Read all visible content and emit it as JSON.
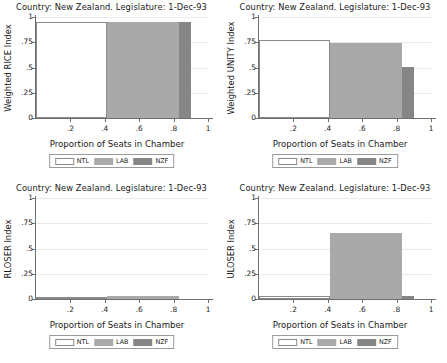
{
  "figure": {
    "panel_title": "Country: New Zealand. Legislature: 1-Dec-93",
    "xlabel": "Proportion of Seats in Chamber",
    "legend": {
      "items": [
        {
          "key": "ntl",
          "label": "NTL",
          "color": "#ffffff"
        },
        {
          "key": "lab",
          "label": "LAB",
          "color": "#a9a9a9"
        },
        {
          "key": "nzf",
          "label": "NZF",
          "color": "#868686"
        }
      ]
    },
    "xticks": [
      "0",
      ".2",
      ".4",
      ".6",
      ".8",
      "1"
    ],
    "yticks": [
      "0",
      ".25",
      ".5",
      ".75",
      "1"
    ]
  },
  "chart_data": [
    {
      "id": "rice",
      "type": "bar",
      "title": "Country: New Zealand. Legislature: 1-Dec-93",
      "xlabel": "Proportion of Seats in Chamber",
      "ylabel": "Weighted RICE Index",
      "xlim": [
        0,
        1
      ],
      "ylim": [
        0,
        1
      ],
      "xticks": [
        0,
        0.2,
        0.4,
        0.6,
        0.8,
        1
      ],
      "xtick_labels": [
        "0",
        ".2",
        ".4",
        ".6",
        ".8",
        "1"
      ],
      "yticks": [
        0,
        0.25,
        0.5,
        0.75,
        1
      ],
      "ytick_labels": [
        "0",
        ".25",
        ".5",
        ".75",
        "1"
      ],
      "grid": true,
      "legend_position": "bottom",
      "bars": [
        {
          "name": "NTL",
          "x_start": 0.0,
          "x_end": 0.41,
          "width": 0.41,
          "value": 0.95
        },
        {
          "name": "LAB",
          "x_start": 0.41,
          "x_end": 0.83,
          "width": 0.42,
          "value": 0.95
        },
        {
          "name": "NZF",
          "x_start": 0.83,
          "x_end": 0.9,
          "width": 0.07,
          "value": 0.95
        }
      ]
    },
    {
      "id": "unity",
      "type": "bar",
      "title": "Country: New Zealand. Legislature: 1-Dec-93",
      "xlabel": "Proportion of Seats in Chamber",
      "ylabel": "Weighted UNITY Index",
      "xlim": [
        0,
        1
      ],
      "ylim": [
        0,
        1
      ],
      "xticks": [
        0,
        0.2,
        0.4,
        0.6,
        0.8,
        1
      ],
      "xtick_labels": [
        "0",
        ".2",
        ".4",
        ".6",
        ".8",
        "1"
      ],
      "yticks": [
        0,
        0.25,
        0.5,
        0.75,
        1
      ],
      "ytick_labels": [
        "0",
        ".25",
        ".5",
        ".75",
        "1"
      ],
      "grid": true,
      "legend_position": "bottom",
      "bars": [
        {
          "name": "NTL",
          "x_start": 0.0,
          "x_end": 0.41,
          "width": 0.41,
          "value": 0.77
        },
        {
          "name": "LAB",
          "x_start": 0.41,
          "x_end": 0.83,
          "width": 0.42,
          "value": 0.745
        },
        {
          "name": "NZF",
          "x_start": 0.83,
          "x_end": 0.9,
          "width": 0.07,
          "value": 0.51
        }
      ]
    },
    {
      "id": "rloser",
      "type": "bar",
      "title": "Country: New Zealand. Legislature: 1-Dec-93",
      "xlabel": "Proportion of Seats in Chamber",
      "ylabel": "RLOSER Index",
      "xlim": [
        0,
        1
      ],
      "ylim": [
        0,
        1
      ],
      "xticks": [
        0,
        0.2,
        0.4,
        0.6,
        0.8,
        1
      ],
      "xtick_labels": [
        "0",
        ".2",
        ".4",
        ".6",
        ".8",
        "1"
      ],
      "yticks": [
        0,
        0.25,
        0.5,
        0.75,
        1
      ],
      "ytick_labels": [
        "0",
        ".25",
        ".5",
        ".75",
        "1"
      ],
      "grid": true,
      "legend_position": "bottom",
      "bars": [
        {
          "name": "NTL",
          "x_start": 0.0,
          "x_end": 0.41,
          "width": 0.41,
          "value": 0.022
        },
        {
          "name": "LAB",
          "x_start": 0.41,
          "x_end": 0.83,
          "width": 0.42,
          "value": 0.025
        },
        {
          "name": "NZF",
          "x_start": 0.83,
          "x_end": 0.9,
          "width": 0.07,
          "value": 0.0
        }
      ]
    },
    {
      "id": "uloser",
      "type": "bar",
      "title": "Country: New Zealand. Legislature: 1-Dec-93",
      "xlabel": "Proportion of Seats in Chamber",
      "ylabel": "ULOSER Index",
      "xlim": [
        0,
        1
      ],
      "ylim": [
        0,
        1
      ],
      "xticks": [
        0,
        0.2,
        0.4,
        0.6,
        0.8,
        1
      ],
      "xtick_labels": [
        "0",
        ".2",
        ".4",
        ".6",
        ".8",
        "1"
      ],
      "yticks": [
        0,
        0.25,
        0.5,
        0.75,
        1
      ],
      "ytick_labels": [
        "0",
        ".25",
        ".5",
        ".75",
        "1"
      ],
      "grid": true,
      "legend_position": "bottom",
      "bars": [
        {
          "name": "NTL",
          "x_start": 0.0,
          "x_end": 0.41,
          "width": 0.41,
          "value": 0.025
        },
        {
          "name": "LAB",
          "x_start": 0.41,
          "x_end": 0.83,
          "width": 0.42,
          "value": 0.65
        },
        {
          "name": "NZF",
          "x_start": 0.83,
          "x_end": 0.9,
          "width": 0.07,
          "value": 0.03
        }
      ]
    }
  ]
}
